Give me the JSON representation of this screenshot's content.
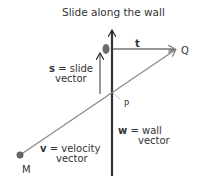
{
  "title": "Slide along the wall",
  "labels": {
    "t": "t",
    "Q": "Q",
    "P": "P",
    "M": "M",
    "s_symbol": "s",
    "s_rest": " = slide",
    "s_line2": "vector",
    "w_symbol": "w",
    "w_rest": " = wall",
    "w_line2": "vector",
    "v_symbol": "v",
    "v_rest": " = velocity",
    "v_line2": "vector"
  },
  "colors": {
    "wall": "#333333",
    "velocity": "#888888",
    "tangent": "#777777",
    "point": "#666666",
    "text": "#333333"
  }
}
